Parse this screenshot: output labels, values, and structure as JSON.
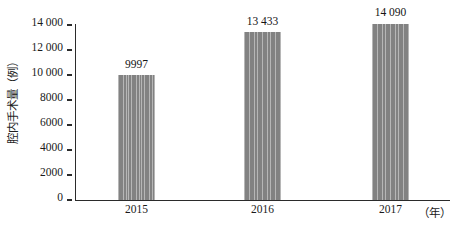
{
  "chart_data": {
    "type": "bar",
    "title": "",
    "xlabel": "（年）",
    "ylabel": "腔内手术量（例）",
    "categories": [
      "2015",
      "2016",
      "2017"
    ],
    "values": [
      9997,
      13433,
      14090
    ],
    "value_labels": [
      "9997",
      "13 433",
      "14 090"
    ],
    "ylim": [
      0,
      14000
    ],
    "yticks": [
      0,
      2000,
      4000,
      6000,
      8000,
      10000,
      12000,
      14000
    ],
    "ytick_labels": [
      "0",
      "2000",
      "4000",
      "6000",
      "8000",
      "10 000",
      "12 000",
      "14 000"
    ],
    "grid": false,
    "legend": null,
    "bar_color": "#8a8a8a",
    "axis_color": "#2b2b2b",
    "background": "#ffffff"
  }
}
